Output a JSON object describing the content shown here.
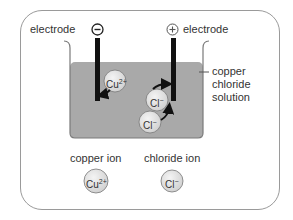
{
  "diagram": {
    "labels": {
      "negative_electrode": "electrode",
      "positive_electrode": "electrode",
      "negative_sign": "−",
      "positive_sign": "+",
      "solution": "copper chloride solution",
      "solution_line1": "copper",
      "solution_line2": "chloride",
      "solution_line3": "solution"
    },
    "ions_in_solution": [
      {
        "symbol": "Cu",
        "charge": "2+",
        "moves_to": "negative electrode"
      },
      {
        "symbol": "Cl",
        "charge": "−",
        "moves_to": "positive electrode"
      },
      {
        "symbol": "Cl",
        "charge": "−",
        "moves_to": "positive electrode"
      }
    ],
    "key": [
      {
        "label": "copper ion",
        "symbol": "Cu",
        "charge": "2+"
      },
      {
        "label": "chloride ion",
        "symbol": "Cl",
        "charge": "−"
      }
    ],
    "colors": {
      "solution": "#a9a9a9",
      "electrode": "#111111",
      "ion_fill": "#e4e4e4",
      "frame": "#9a9a9a"
    }
  }
}
